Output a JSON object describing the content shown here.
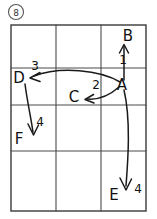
{
  "figure": {
    "badge_label": "8",
    "grid": {
      "columns": 3,
      "rows": 4,
      "left": 11,
      "top": 25,
      "right": 146,
      "bottom": 211,
      "v_lines": [
        56,
        101
      ],
      "h_lines": [
        68,
        105,
        151
      ],
      "line_color": "#4a4a4a",
      "border_color": "#3a3a3a"
    },
    "nodes": [
      {
        "id": "A",
        "label": "A",
        "x": 122,
        "y": 84
      },
      {
        "id": "B",
        "label": "B",
        "x": 128,
        "y": 37
      },
      {
        "id": "C",
        "label": "C",
        "x": 74,
        "y": 97
      },
      {
        "id": "D",
        "label": "D",
        "x": 17,
        "y": 79
      },
      {
        "id": "E",
        "label": "E",
        "x": 113,
        "y": 196
      },
      {
        "id": "F",
        "label": "F",
        "x": 17,
        "y": 139
      }
    ],
    "edges": [
      {
        "number": "1",
        "from": "A",
        "to": "B",
        "label_x": 123,
        "label_y": 64,
        "shape": "straight-up"
      },
      {
        "number": "2",
        "from": "A",
        "to": "C",
        "label_x": 96,
        "label_y": 89,
        "shape": "curve-left"
      },
      {
        "number": "3",
        "from": "A",
        "to": "D",
        "label_x": 35,
        "label_y": 70,
        "shape": "long-curve-left"
      },
      {
        "number": "4",
        "from": "D",
        "to": "F",
        "label_x": 39,
        "label_y": 126,
        "shape": "down-left"
      },
      {
        "number": "4",
        "from": "A",
        "to": "E",
        "label_x": 137,
        "label_y": 193,
        "shape": "curve-down"
      }
    ],
    "numbers_shown": [
      "1",
      "2",
      "3",
      "4",
      "4"
    ],
    "node_letters": [
      "A",
      "B",
      "C",
      "D",
      "E",
      "F"
    ],
    "stroke_color": "#1a1a1a",
    "background_color": "#ffffff"
  }
}
